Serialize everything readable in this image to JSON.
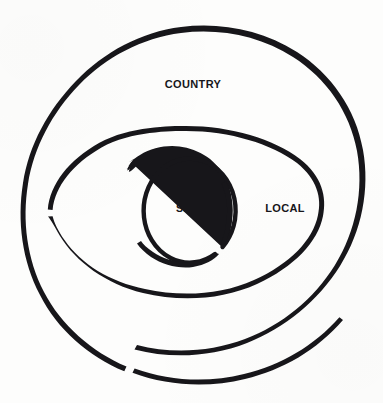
{
  "figure": {
    "type": "concentric-spiral",
    "background_color": "#fdfdfc",
    "stroke_color": "#17161a",
    "canvas": {
      "width": 383,
      "height": 403
    }
  },
  "rings": [
    {
      "id": "country",
      "label": "COUNTRY",
      "level": 3,
      "description": "outermost ring",
      "label_position": {
        "x": 193,
        "y": 84
      },
      "bounds": {
        "left": 25,
        "top": 32,
        "right": 357,
        "bottom": 383
      },
      "gap_position": "bottom-left",
      "stroke_width": 4.2
    },
    {
      "id": "local",
      "label": "LOCAL",
      "level": 2,
      "description": "middle ring",
      "label_position": {
        "x": 285,
        "y": 208
      },
      "bounds": {
        "left": 48,
        "top": 126,
        "right": 325,
        "bottom": 300
      },
      "gap_position": "left",
      "stroke_width": 4.6
    },
    {
      "id": "self",
      "label": "SELF",
      "level": 1,
      "description": "innermost ring",
      "label_position": {
        "x": 190,
        "y": 208
      },
      "bounds": {
        "left": 133,
        "top": 152,
        "right": 228,
        "bottom": 262
      },
      "gap_position": "lower-right",
      "stroke_width": 4.4
    }
  ]
}
